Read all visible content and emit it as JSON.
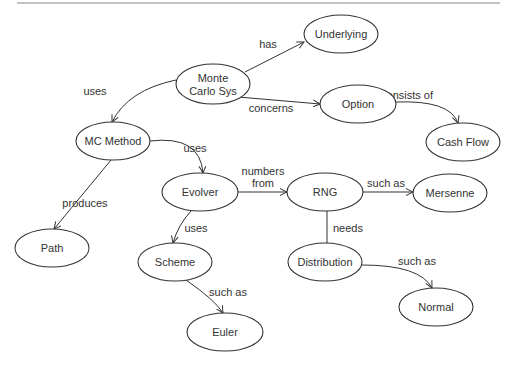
{
  "diagram": {
    "type": "concept-map",
    "nodes": [
      {
        "id": "montecarlo",
        "label_lines": [
          "Monte",
          "Carlo Sys"
        ],
        "cx": 213,
        "cy": 84,
        "rx": 37,
        "ry": 20
      },
      {
        "id": "underlying",
        "label_lines": [
          "Underlying"
        ],
        "cx": 341,
        "cy": 34,
        "rx": 37,
        "ry": 19
      },
      {
        "id": "option",
        "label_lines": [
          "Option"
        ],
        "cx": 358,
        "cy": 104,
        "rx": 38,
        "ry": 19
      },
      {
        "id": "cashflow",
        "label_lines": [
          "Cash Flow"
        ],
        "cx": 463,
        "cy": 142,
        "rx": 37,
        "ry": 19
      },
      {
        "id": "mcmethod",
        "label_lines": [
          "MC Method"
        ],
        "cx": 113,
        "cy": 141,
        "rx": 37,
        "ry": 19
      },
      {
        "id": "evolver",
        "label_lines": [
          "Evolver"
        ],
        "cx": 200,
        "cy": 192,
        "rx": 38,
        "ry": 19
      },
      {
        "id": "rng",
        "label_lines": [
          "RNG"
        ],
        "cx": 325,
        "cy": 192,
        "rx": 38,
        "ry": 19
      },
      {
        "id": "mersenne",
        "label_lines": [
          "Mersenne"
        ],
        "cx": 450,
        "cy": 193,
        "rx": 37,
        "ry": 19
      },
      {
        "id": "path",
        "label_lines": [
          "Path"
        ],
        "cx": 52,
        "cy": 248,
        "rx": 37,
        "ry": 19
      },
      {
        "id": "scheme",
        "label_lines": [
          "Scheme"
        ],
        "cx": 175,
        "cy": 262,
        "rx": 37,
        "ry": 19
      },
      {
        "id": "distribution",
        "label_lines": [
          "Distribution"
        ],
        "cx": 325,
        "cy": 262,
        "rx": 37,
        "ry": 19
      },
      {
        "id": "normal",
        "label_lines": [
          "Normal"
        ],
        "cx": 436,
        "cy": 307,
        "rx": 37,
        "ry": 19
      },
      {
        "id": "euler",
        "label_lines": [
          "Euler"
        ],
        "cx": 225,
        "cy": 332,
        "rx": 38,
        "ry": 19
      }
    ],
    "edges": [
      {
        "from": "montecarlo",
        "to": "underlying",
        "label_lines": [
          "has"
        ],
        "d": "M 245 72 L 304 42",
        "arrow": true,
        "label_x": 268,
        "label_y": 48
      },
      {
        "from": "montecarlo",
        "to": "option",
        "label_lines": [
          "concerns"
        ],
        "d": "M 238 97 L 320 104",
        "arrow": true,
        "label_x": 271,
        "label_y": 112
      },
      {
        "from": "option",
        "to": "cashflow",
        "label_lines": [
          "consists of"
        ],
        "d": "M 396 102 Q 450 100 458 123",
        "arrow": true,
        "label_x": 407,
        "label_y": 99
      },
      {
        "from": "montecarlo",
        "to": "mcmethod",
        "label_lines": [
          "uses"
        ],
        "d": "M 176 80 Q 128 90 112 122",
        "arrow": true,
        "label_x": 95,
        "label_y": 95
      },
      {
        "from": "mcmethod",
        "to": "evolver",
        "label_lines": [
          "uses"
        ],
        "d": "M 150 141 Q 200 135 203 173",
        "arrow": true,
        "label_x": 195,
        "label_y": 152
      },
      {
        "from": "mcmethod",
        "to": "path",
        "label_lines": [
          "produces"
        ],
        "d": "M 111 160 L 54 229",
        "arrow": true,
        "label_x": 85,
        "label_y": 207
      },
      {
        "from": "evolver",
        "to": "rng",
        "label_lines": [
          "numbers",
          "from"
        ],
        "d": "M 238 192 L 287 192",
        "arrow": true,
        "label_x": 263,
        "label_y": 175
      },
      {
        "from": "rng",
        "to": "mersenne",
        "label_lines": [
          "such as"
        ],
        "d": "M 363 192 L 413 192",
        "arrow": true,
        "label_x": 386,
        "label_y": 187
      },
      {
        "from": "evolver",
        "to": "scheme",
        "label_lines": [
          "uses"
        ],
        "d": "M 191 211 Q 178 225 173 243",
        "arrow": true,
        "label_x": 196,
        "label_y": 232
      },
      {
        "from": "rng",
        "to": "distribution",
        "label_lines": [
          "needs"
        ],
        "d": "M 327 211 L 327 243",
        "arrow": false,
        "label_x": 348,
        "label_y": 232
      },
      {
        "from": "scheme",
        "to": "euler",
        "label_lines": [
          "such as"
        ],
        "d": "M 186 280 Q 215 300 223 313",
        "arrow": true,
        "label_x": 228,
        "label_y": 296
      },
      {
        "from": "distribution",
        "to": "normal",
        "label_lines": [
          "such as"
        ],
        "d": "M 362 265 Q 420 265 432 288",
        "arrow": true,
        "label_x": 417,
        "label_y": 265
      }
    ]
  }
}
